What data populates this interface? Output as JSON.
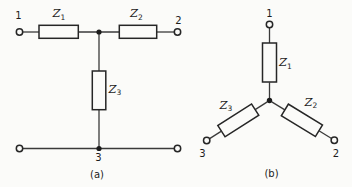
{
  "colors": {
    "background": "#fbfbf9",
    "line": "#262626",
    "wire": "#3a3a3a",
    "text": "#1c1c1c"
  },
  "figure_a": {
    "caption": "(a)",
    "network_type": "T-network",
    "terminals": {
      "t1": "1",
      "t2": "2",
      "t3": "3"
    },
    "impedances": {
      "z1": {
        "base": "Z",
        "sub": "1"
      },
      "z2": {
        "base": "Z",
        "sub": "2"
      },
      "z3": {
        "base": "Z",
        "sub": "3"
      }
    }
  },
  "figure_b": {
    "caption": "(b)",
    "network_type": "star-network",
    "terminals": {
      "t1": "1",
      "t2": "2",
      "t3": "3"
    },
    "impedances": {
      "z1": {
        "base": "Z",
        "sub": "1"
      },
      "z2": {
        "base": "Z",
        "sub": "2"
      },
      "z3": {
        "base": "Z",
        "sub": "3"
      }
    }
  }
}
